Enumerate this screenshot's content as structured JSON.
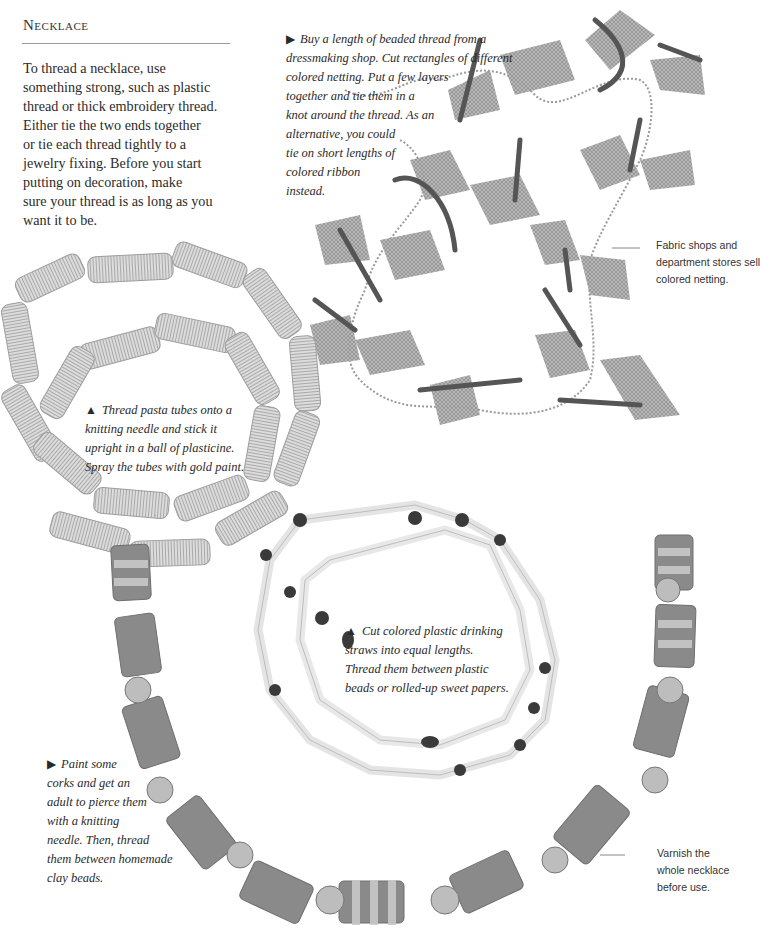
{
  "page": {
    "heading": "Necklace",
    "intro_lines": [
      "To thread a necklace, use",
      "something strong, such as plastic",
      "thread or thick embroidery thread.",
      "Either tie the two ends together",
      "or tie each thread tightly to a",
      "jewelry fixing. Before you start",
      "putting on decoration, make",
      "sure your thread is as long as you",
      "want it to be."
    ]
  },
  "captions": {
    "netting": {
      "bullet": "▶",
      "lines": [
        "Buy a length of beaded thread from a",
        "dressmaking shop. Cut rectangles of different",
        "colored netting. Put a few layers",
        "together and tie them in a",
        "knot around the thread. As an",
        "alternative, you could",
        "tie on short lengths of",
        "colored ribbon",
        "instead."
      ]
    },
    "pasta": {
      "bullet": "▲",
      "lines": [
        "Thread pasta tubes onto a",
        "knitting needle and stick it",
        "upright in a ball of plasticine.",
        "Spray the tubes with gold paint."
      ]
    },
    "straws": {
      "bullet": "▲",
      "lines": [
        "Cut colored plastic drinking",
        "straws into equal lengths.",
        "Thread them between plastic",
        "beads or rolled-up sweet papers."
      ]
    },
    "corks": {
      "bullet": "▶",
      "lines": [
        "Paint some",
        "corks and get an",
        "adult to pierce them",
        "with a knitting",
        "needle. Then, thread",
        "them between homemade",
        "clay beads."
      ]
    }
  },
  "notes": {
    "fabric": [
      "Fabric shops and",
      "department stores sell",
      "colored netting."
    ],
    "varnish": [
      "Varnish the",
      "whole necklace",
      "before use."
    ]
  },
  "images": {
    "netting_necklace": "Beaded chain with tied netting and ribbon bows",
    "pasta_necklace": "Two loops of ridged pasta tubes",
    "straw_necklace": "Drinking straw segments with dark plastic beads",
    "cork_necklace": "Striped painted corks with spotted clay beads"
  },
  "colors": {
    "text": "#2a2a2a",
    "rule": "#9a9a9a",
    "pasta": "#d4d4d4",
    "netting": "#8f8f8f",
    "ribbon": "#555555",
    "straw": "#e6e6e6",
    "bead_dark": "#3a3a3a",
    "cork": "#8a8a8a",
    "cork_stripe": "#c9c9c9"
  }
}
